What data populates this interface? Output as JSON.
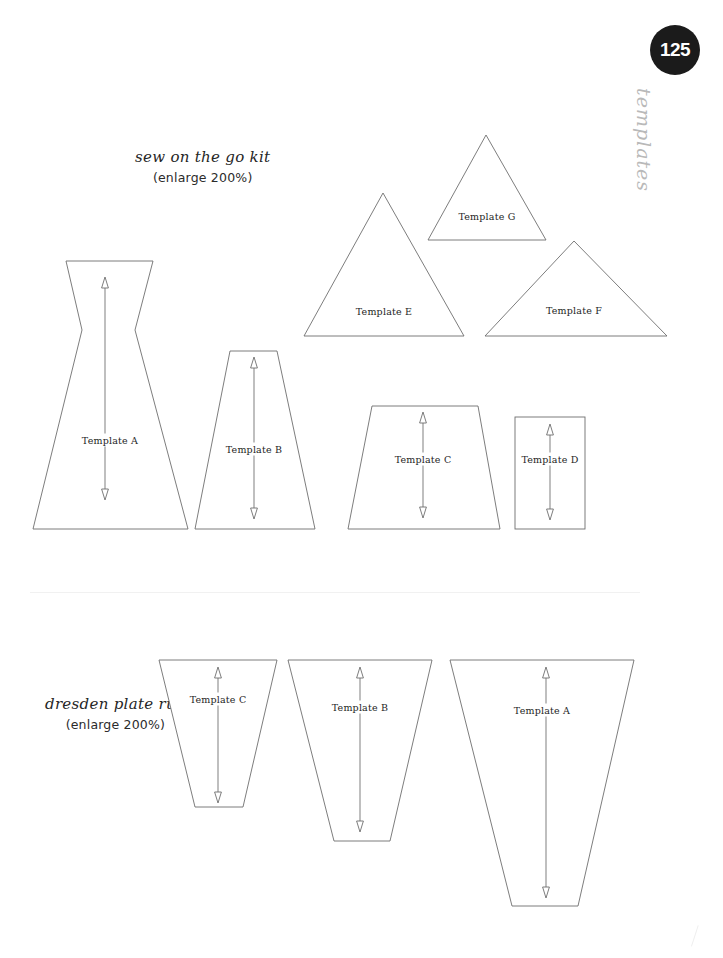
{
  "page": {
    "number": "125",
    "side_word": "templates",
    "background_color": "#ffffff",
    "badge_color": "#1b1b1b",
    "stroke_color": "#6e6e6e"
  },
  "sections": [
    {
      "id": "sew-on-the-go-kit",
      "title": "sew on the go kit",
      "enlarge_note": "(enlarge 200%)",
      "pieces": [
        {
          "label": "Template A",
          "shape": "hourglass",
          "label_x": 110,
          "label_y": 440
        },
        {
          "label": "Template B",
          "shape": "trapezoid",
          "label_x": 254,
          "label_y": 449
        },
        {
          "label": "Template C",
          "shape": "trapezoid",
          "label_x": 423,
          "label_y": 459
        },
        {
          "label": "Template D",
          "shape": "rectangle",
          "label_x": 550,
          "label_y": 459
        },
        {
          "label": "Template E",
          "shape": "triangle",
          "label_x": 384,
          "label_y": 311
        },
        {
          "label": "Template F",
          "shape": "triangle",
          "label_x": 574,
          "label_y": 310
        },
        {
          "label": "Template G",
          "shape": "triangle",
          "label_x": 487,
          "label_y": 216
        }
      ]
    },
    {
      "id": "dresden-plate-rug",
      "title": "dresden plate rug",
      "enlarge_note": "(enlarge 200%)",
      "pieces": [
        {
          "label": "Template C",
          "shape": "wedge",
          "label_x": 218,
          "label_y": 699
        },
        {
          "label": "Template B",
          "shape": "wedge",
          "label_x": 360,
          "label_y": 707
        },
        {
          "label": "Template A",
          "shape": "wedge",
          "label_x": 542,
          "label_y": 710
        }
      ]
    }
  ],
  "geometry": {
    "sew_A_outline": "66,261 153,261 135,330 188,529 33,529 82,330",
    "sew_B_outline": "230,351 277,351 315,529 195,529",
    "sew_C_outline": "372,406 478,406 500,529 348,529",
    "sew_D_rect": {
      "x": 515,
      "y": 417,
      "w": 70,
      "h": 112
    },
    "sew_E_outline": "383,193 464,336 304,336",
    "sew_F_outline": "574,241 667,336 485,336",
    "sew_G_outline": "486,135 546,240 428,240",
    "dres_C_outline": "159,660 277,660 243,807 195,807",
    "dres_B_outline": "288,660 432,660 390,841 334,841",
    "dres_A_outline": "450,660 634,660 578,906 512,906",
    "arrows": [
      {
        "x": 105,
        "y1": 277,
        "y2": 500
      },
      {
        "x": 254,
        "y1": 357,
        "y2": 519
      },
      {
        "x": 423,
        "y1": 412,
        "y2": 518
      },
      {
        "x": 550,
        "y1": 424,
        "y2": 520
      },
      {
        "x": 218,
        "y1": 667,
        "y2": 803
      },
      {
        "x": 360,
        "y1": 667,
        "y2": 832
      },
      {
        "x": 546,
        "y1": 667,
        "y2": 898
      }
    ]
  }
}
